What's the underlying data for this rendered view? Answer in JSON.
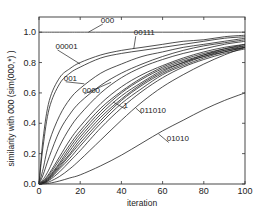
{
  "chart_data": {
    "type": "line",
    "title": "",
    "xlabel": "iteration",
    "ylabel": "similarity with 000  (sim(000,*) )",
    "xlim": [
      0,
      100
    ],
    "ylim": [
      0.0,
      1.1
    ],
    "x_ticks": [
      0,
      20,
      40,
      60,
      80,
      100
    ],
    "y_ticks": [
      0.0,
      0.2,
      0.4,
      0.6,
      0.8,
      1.0
    ],
    "x_tick_labels": [
      "0",
      "20",
      "40",
      "60",
      "80",
      "100"
    ],
    "y_tick_labels": [
      "0.0",
      "0.2",
      "0.4",
      "0.6",
      "0.8",
      "1.0"
    ],
    "grid": false,
    "legend": "none (inline annotations)",
    "x": [
      0,
      2,
      5,
      10,
      15,
      20,
      30,
      40,
      50,
      60,
      70,
      80,
      90,
      100
    ],
    "series": [
      {
        "name": "000",
        "labeled": true,
        "values": [
          1.0,
          1.0,
          1.0,
          1.0,
          1.0,
          1.0,
          1.0,
          1.0,
          1.0,
          1.0,
          1.0,
          1.0,
          1.0,
          1.0
        ]
      },
      {
        "name": "00111",
        "labeled": true,
        "values": [
          0.0,
          0.3,
          0.55,
          0.7,
          0.76,
          0.8,
          0.85,
          0.88,
          0.9,
          0.92,
          0.94,
          0.95,
          0.97,
          0.98
        ]
      },
      {
        "name": "00001",
        "labeled": true,
        "values": [
          0.0,
          0.25,
          0.5,
          0.66,
          0.73,
          0.77,
          0.83,
          0.86,
          0.88,
          0.9,
          0.92,
          0.94,
          0.96,
          0.97
        ]
      },
      {
        "name": "001",
        "labeled": true,
        "values": [
          0.0,
          0.1,
          0.28,
          0.45,
          0.56,
          0.63,
          0.73,
          0.79,
          0.84,
          0.87,
          0.9,
          0.92,
          0.94,
          0.96
        ]
      },
      {
        "name": "0000",
        "labeled": true,
        "values": [
          0.0,
          0.06,
          0.18,
          0.35,
          0.46,
          0.54,
          0.65,
          0.73,
          0.79,
          0.84,
          0.88,
          0.91,
          0.93,
          0.95
        ]
      },
      {
        "name": "",
        "labeled": false,
        "values": [
          0.0,
          0.03,
          0.1,
          0.25,
          0.37,
          0.46,
          0.6,
          0.7,
          0.77,
          0.82,
          0.86,
          0.89,
          0.92,
          0.94
        ]
      },
      {
        "name": "1",
        "labeled": true,
        "values": [
          0.0,
          0.02,
          0.07,
          0.18,
          0.29,
          0.38,
          0.53,
          0.64,
          0.72,
          0.78,
          0.83,
          0.87,
          0.9,
          0.92
        ]
      },
      {
        "name": "",
        "labeled": false,
        "values": [
          0.0,
          0.015,
          0.06,
          0.16,
          0.26,
          0.35,
          0.5,
          0.61,
          0.7,
          0.77,
          0.82,
          0.86,
          0.89,
          0.92
        ]
      },
      {
        "name": "",
        "labeled": false,
        "values": [
          0.0,
          0.012,
          0.05,
          0.14,
          0.24,
          0.33,
          0.48,
          0.6,
          0.69,
          0.76,
          0.81,
          0.85,
          0.89,
          0.91
        ]
      },
      {
        "name": "",
        "labeled": false,
        "values": [
          0.0,
          0.01,
          0.045,
          0.13,
          0.22,
          0.31,
          0.46,
          0.58,
          0.67,
          0.75,
          0.8,
          0.85,
          0.88,
          0.91
        ]
      },
      {
        "name": "",
        "labeled": false,
        "values": [
          0.0,
          0.008,
          0.04,
          0.12,
          0.2,
          0.29,
          0.44,
          0.56,
          0.66,
          0.74,
          0.8,
          0.84,
          0.88,
          0.9
        ]
      },
      {
        "name": "",
        "labeled": false,
        "values": [
          0.0,
          0.006,
          0.035,
          0.11,
          0.19,
          0.27,
          0.42,
          0.55,
          0.65,
          0.73,
          0.79,
          0.84,
          0.87,
          0.9
        ]
      },
      {
        "name": "",
        "labeled": false,
        "values": [
          0.0,
          0.005,
          0.03,
          0.1,
          0.17,
          0.25,
          0.4,
          0.53,
          0.63,
          0.72,
          0.78,
          0.83,
          0.87,
          0.9
        ]
      },
      {
        "name": "",
        "labeled": false,
        "values": [
          0.0,
          0.004,
          0.025,
          0.08,
          0.15,
          0.22,
          0.37,
          0.5,
          0.61,
          0.7,
          0.77,
          0.82,
          0.86,
          0.89
        ]
      },
      {
        "name": "011010",
        "labeled": true,
        "values": [
          0.0,
          0.003,
          0.015,
          0.05,
          0.1,
          0.16,
          0.29,
          0.42,
          0.54,
          0.64,
          0.72,
          0.79,
          0.85,
          0.9
        ]
      },
      {
        "name": "01010",
        "labeled": true,
        "values": [
          0.0,
          0.001,
          0.005,
          0.02,
          0.04,
          0.06,
          0.12,
          0.19,
          0.27,
          0.35,
          0.42,
          0.49,
          0.55,
          0.6
        ]
      }
    ],
    "annotations": [
      {
        "text": "000",
        "x": 30,
        "y": 1.06,
        "points_to": [
          24,
          1.0
        ]
      },
      {
        "text": "00111",
        "x": 46,
        "y": 0.98,
        "points_to": [
          46,
          0.89
        ]
      },
      {
        "text": "00001",
        "x": 8,
        "y": 0.89,
        "points_to": [
          20,
          0.79
        ]
      },
      {
        "text": "001",
        "x": 12,
        "y": 0.68,
        "points_to": [
          22,
          0.66
        ]
      },
      {
        "text": "0000",
        "x": 21,
        "y": 0.6,
        "points_to": [
          35,
          0.67
        ]
      },
      {
        "text": "1",
        "x": 41,
        "y": 0.5,
        "points_to": [
          36,
          0.54
        ]
      },
      {
        "text": "011010",
        "x": 49,
        "y": 0.47,
        "points_to": [
          47,
          0.5
        ]
      },
      {
        "text": "01010",
        "x": 62,
        "y": 0.28,
        "points_to": [
          58,
          0.33
        ]
      }
    ]
  }
}
